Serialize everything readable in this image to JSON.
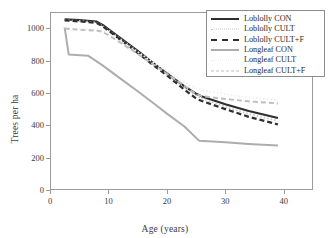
{
  "chart_data": {
    "type": "line",
    "title": "",
    "xlabel": "Age (years)",
    "ylabel": "Trees per ha",
    "xlim": [
      0,
      45
    ],
    "ylim": [
      0,
      1100
    ],
    "xticks": [
      0,
      10,
      20,
      30,
      40
    ],
    "ytick_labels": [
      "0",
      "200",
      "400",
      "600",
      "800",
      "1000"
    ],
    "yticks": [
      0,
      200,
      400,
      600,
      800,
      1000
    ],
    "grid": false,
    "legend_position": "top-right",
    "series": [
      {
        "name": "Loblolly CON",
        "style": "solid",
        "color": "#2e2e2e",
        "width": 2.2,
        "x": [
          2.5,
          5,
          8,
          9,
          12,
          15,
          18,
          20,
          23,
          25,
          26,
          30,
          34,
          39
        ],
        "y": [
          1055,
          1050,
          1040,
          1020,
          940,
          860,
          775,
          720,
          640,
          595,
          578,
          530,
          488,
          445
        ]
      },
      {
        "name": "Loblolly CULT",
        "style": "dotted",
        "color": "#c9c9c9",
        "width": 1.7,
        "x": [
          2.5,
          5,
          8,
          9,
          12,
          15,
          18,
          20,
          23,
          25,
          26,
          30,
          34,
          39
        ],
        "y": [
          1050,
          1045,
          1035,
          1015,
          935,
          855,
          770,
          715,
          632,
          585,
          566,
          515,
          470,
          428
        ]
      },
      {
        "name": "Loblolly CULT+F",
        "style": "dashed",
        "color": "#2e2e2e",
        "width": 2.2,
        "x": [
          2.5,
          5,
          8,
          9,
          12,
          15,
          18,
          20,
          23,
          25,
          26,
          30,
          34,
          39
        ],
        "y": [
          1048,
          1042,
          1032,
          1012,
          930,
          848,
          762,
          708,
          620,
          565,
          550,
          500,
          452,
          405
        ]
      },
      {
        "name": "Longleaf CON",
        "style": "solid",
        "color": "#adadad",
        "width": 2,
        "x": [
          2.5,
          3.2,
          6.5,
          9,
          12,
          15,
          18,
          20,
          23,
          25.5,
          30,
          34,
          39
        ],
        "y": [
          1005,
          838,
          830,
          770,
          690,
          610,
          528,
          472,
          392,
          305,
          295,
          285,
          275
        ]
      },
      {
        "name": "Longleaf CULT",
        "style": "dotted",
        "color": "#ededed",
        "width": 1.6,
        "x": [
          2.5,
          5,
          8,
          9,
          12,
          15,
          18,
          20,
          23,
          25,
          26,
          30,
          34,
          39
        ],
        "y": [
          1002,
          998,
          992,
          985,
          922,
          852,
          782,
          735,
          665,
          630,
          618,
          592,
          572,
          555
        ]
      },
      {
        "name": "Longleaf CULT+F",
        "style": "dashed",
        "color": "#bdbdbd",
        "width": 1.9,
        "x": [
          2.5,
          5,
          8,
          9,
          12,
          15,
          18,
          20,
          23,
          25,
          26,
          30,
          34,
          39
        ],
        "y": [
          998,
          990,
          985,
          978,
          912,
          840,
          768,
          718,
          645,
          592,
          580,
          562,
          548,
          535
        ]
      }
    ],
    "legend": [
      {
        "label": "Loblolly CON",
        "swatch": "sw-solid-dark"
      },
      {
        "label": "Loblolly CULT",
        "swatch": "sw-dotted-light"
      },
      {
        "label": "Loblolly CULT+F",
        "swatch": "sw-dashed-dark"
      },
      {
        "label": "Longleaf CON",
        "swatch": "sw-solid-gray"
      },
      {
        "label": "Longleaf CULT",
        "swatch": "sw-dotted-faint"
      },
      {
        "label": "Longleaf CULT+F",
        "swatch": "sw-dashed-gray"
      }
    ]
  }
}
